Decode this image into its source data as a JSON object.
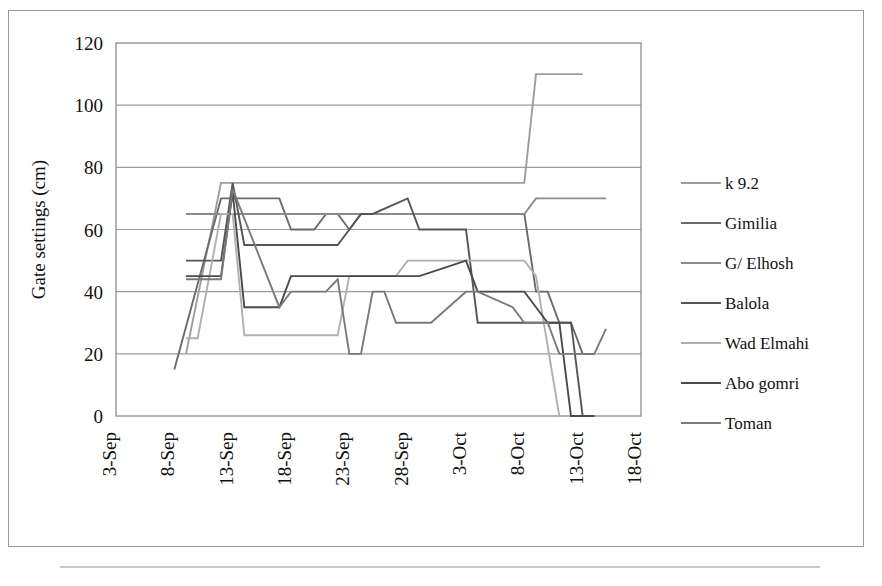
{
  "figure": {
    "y_axis_title": "Gate settings (cm)"
  },
  "chart_data": {
    "type": "line",
    "title": "",
    "xlabel": "",
    "ylabel": "Gate settings (cm)",
    "ylim": [
      0,
      120
    ],
    "yticks": [
      0,
      20,
      40,
      60,
      80,
      100,
      120
    ],
    "ytick_labels": [
      "0",
      "20",
      "40",
      "60",
      "80",
      "100",
      "120"
    ],
    "xlim": [
      "3-Sep",
      "18-Oct"
    ],
    "xticks": [
      0,
      5,
      10,
      15,
      20,
      25,
      30,
      35,
      40,
      45
    ],
    "xtick_labels": [
      "3-Sep",
      "8-Sep",
      "13-Sep",
      "18-Sep",
      "23-Sep",
      "28-Sep",
      "3-Oct",
      "8-Oct",
      "13-Oct",
      "18-Oct"
    ],
    "grid": "horizontal",
    "legend_position": "right",
    "series": [
      {
        "name": "k 9.2",
        "color": "#9d9d9d",
        "x": [
          6,
          9,
          10,
          34,
          35,
          36,
          40
        ],
        "values": [
          20,
          75,
          75,
          75,
          75,
          110,
          110
        ]
      },
      {
        "name": "Gimilia",
        "color": "#6b6b6b",
        "x": [
          5,
          9,
          10,
          11,
          14,
          15,
          17,
          18,
          19,
          20,
          21,
          22,
          25,
          26,
          30,
          31,
          35,
          36,
          37,
          38,
          39,
          40,
          41
        ],
        "values": [
          15,
          70,
          70,
          70,
          70,
          60,
          60,
          65,
          65,
          60,
          65,
          65,
          65,
          65,
          65,
          65,
          65,
          40,
          40,
          30,
          30,
          20,
          20
        ]
      },
      {
        "name": "G/ Elhosh",
        "color": "#8b8b8b",
        "x": [
          6,
          7,
          10,
          14,
          19,
          20,
          25,
          30,
          34,
          35,
          36,
          40,
          42
        ],
        "values": [
          65,
          65,
          65,
          65,
          65,
          65,
          65,
          65,
          65,
          65,
          70,
          70,
          70
        ]
      },
      {
        "name": "Balola",
        "color": "#555555",
        "x": [
          6,
          9,
          10,
          11,
          14,
          15,
          19,
          20,
          21,
          22,
          25,
          26,
          27,
          30,
          31,
          35,
          36,
          37,
          38,
          39,
          40,
          41
        ],
        "values": [
          50,
          50,
          75,
          55,
          55,
          55,
          55,
          60,
          65,
          65,
          70,
          60,
          60,
          60,
          30,
          30,
          30,
          30,
          30,
          30,
          0,
          0
        ]
      },
      {
        "name": "Wad Elmahi",
        "color": "#b0b0b0",
        "x": [
          6,
          7,
          9,
          10,
          11,
          14,
          19,
          20,
          24,
          25,
          30,
          31,
          35,
          36,
          38,
          39
        ],
        "values": [
          25,
          25,
          65,
          65,
          26,
          26,
          26,
          45,
          45,
          50,
          50,
          50,
          50,
          45,
          0,
          0
        ]
      },
      {
        "name": "Abo gomri",
        "color": "#4a4a4a",
        "x": [
          6,
          9,
          10,
          11,
          14,
          15,
          18,
          19,
          20,
          21,
          24,
          25,
          26,
          30,
          31,
          35,
          36,
          37,
          38,
          39,
          40,
          41
        ],
        "values": [
          45,
          45,
          72,
          35,
          35,
          45,
          45,
          45,
          45,
          45,
          45,
          45,
          45,
          50,
          40,
          40,
          35,
          30,
          30,
          0,
          0,
          0
        ]
      },
      {
        "name": "Toman",
        "color": "#7a7a7a",
        "x": [
          6,
          9,
          10,
          14,
          15,
          18,
          19,
          20,
          21,
          22,
          23,
          24,
          25,
          26,
          27,
          30,
          31,
          34,
          35,
          36,
          37,
          38,
          39,
          41,
          42
        ],
        "values": [
          44,
          44,
          73,
          35,
          40,
          40,
          44,
          20,
          20,
          40,
          40,
          30,
          30,
          30,
          30,
          40,
          40,
          35,
          30,
          30,
          30,
          20,
          20,
          20,
          28
        ]
      }
    ]
  },
  "legend": {
    "items": [
      {
        "label": "k 9.2"
      },
      {
        "label": "Gimilia"
      },
      {
        "label": "G/ Elhosh"
      },
      {
        "label": "Balola"
      },
      {
        "label": "Wad Elmahi"
      },
      {
        "label": "Abo gomri"
      },
      {
        "label": "Toman"
      }
    ]
  }
}
